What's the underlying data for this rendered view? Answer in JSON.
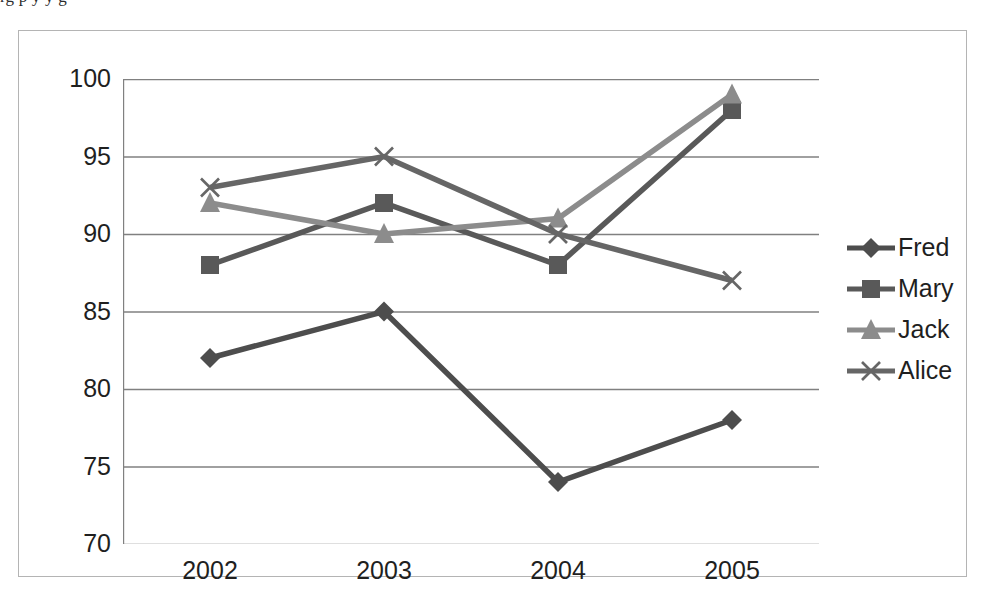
{
  "page": {
    "clipped_top_text": "rg p y y g"
  },
  "chart_data": {
    "type": "line",
    "title": "",
    "subtitle": "",
    "xlabel": "",
    "ylabel": "",
    "categories": [
      "2002",
      "2003",
      "2004",
      "2005"
    ],
    "ylim": [
      70,
      100
    ],
    "y_ticks": [
      "100",
      "95",
      "90",
      "85",
      "80",
      "75",
      "70"
    ],
    "y_tick_values": [
      100,
      95,
      90,
      85,
      80,
      75,
      70
    ],
    "y_tick_step": 5,
    "grid": "horizontal",
    "legend_position": "right",
    "series": [
      {
        "name": "Fred",
        "marker": "diamond",
        "color": "#4d4d4d",
        "values": [
          82,
          85,
          74,
          78
        ]
      },
      {
        "name": "Mary",
        "marker": "square",
        "color": "#595959",
        "values": [
          88,
          92,
          88,
          98
        ]
      },
      {
        "name": "Jack",
        "marker": "triangle",
        "color": "#8c8c8c",
        "values": [
          92,
          90,
          91,
          99
        ]
      },
      {
        "name": "Alice",
        "marker": "cross-x",
        "color": "#666666",
        "values": [
          93,
          95,
          90,
          87
        ]
      }
    ]
  },
  "axis": {
    "line_color": "#808080",
    "grid_color": "#808080",
    "frame_color": "#b4b4b4"
  }
}
